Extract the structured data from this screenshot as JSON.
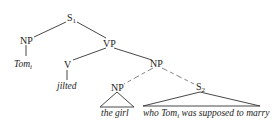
{
  "diagram": {
    "type": "syntax-tree",
    "nodes": {
      "s1": {
        "label": "S",
        "sub": "1"
      },
      "np_subj": {
        "label": "NP"
      },
      "tom": {
        "label": "Tom",
        "sub": "i"
      },
      "vp": {
        "label": "VP"
      },
      "v": {
        "label": "V"
      },
      "jilted": {
        "label": "jilted"
      },
      "np_obj": {
        "label": "NP"
      },
      "np_girl": {
        "label": "NP"
      },
      "the_girl": {
        "label": "the girl"
      },
      "s2": {
        "label": "S",
        "sub": "2"
      },
      "rel_pre": {
        "label": "who Tom"
      },
      "rel_sub": {
        "label": "i"
      },
      "rel_post": {
        "label": " was supposed to marry"
      }
    },
    "edges": [
      [
        "s1",
        "np_subj"
      ],
      [
        "s1",
        "vp"
      ],
      [
        "np_subj",
        "tom"
      ],
      [
        "vp",
        "v"
      ],
      [
        "vp",
        "np_obj"
      ],
      [
        "v",
        "jilted"
      ],
      [
        "np_obj",
        "np_girl"
      ],
      [
        "np_obj",
        "s2"
      ],
      [
        "np_girl",
        "the_girl",
        "triangle"
      ],
      [
        "s2",
        "relative_clause",
        "triangle"
      ]
    ]
  }
}
